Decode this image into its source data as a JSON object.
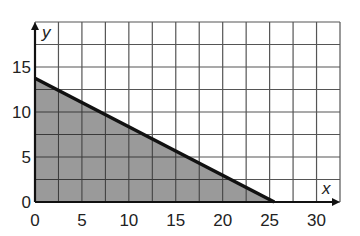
{
  "chart_data": {
    "type": "area",
    "title": "",
    "xlabel": "x",
    "ylabel": "y",
    "xlim": [
      0,
      32.5
    ],
    "ylim": [
      0,
      20
    ],
    "grid": true,
    "grid_step_x": 2.5,
    "grid_step_y": 2.5,
    "x_ticks": [
      0,
      5,
      10,
      15,
      20,
      25,
      30
    ],
    "y_ticks": [
      0,
      5,
      10,
      15
    ],
    "x_tick_labels": [
      "0",
      "5",
      "10",
      "15",
      "20",
      "25",
      "30"
    ],
    "y_tick_labels": [
      "0",
      "5",
      "10",
      "15"
    ],
    "series": [
      {
        "name": "boundary line",
        "points": [
          [
            0,
            13.75
          ],
          [
            25.5,
            0
          ]
        ],
        "style": "solid",
        "color": "#111111"
      }
    ],
    "shaded_region": {
      "description": "region below the line in the first quadrant",
      "vertices": [
        [
          0,
          0
        ],
        [
          0,
          13.75
        ],
        [
          25.5,
          0
        ]
      ],
      "color": "#9a9a9a"
    },
    "legend": null
  },
  "colors": {
    "grid": "#555555",
    "axis": "#111111",
    "shade": "#9a9a9a",
    "line": "#111111"
  }
}
